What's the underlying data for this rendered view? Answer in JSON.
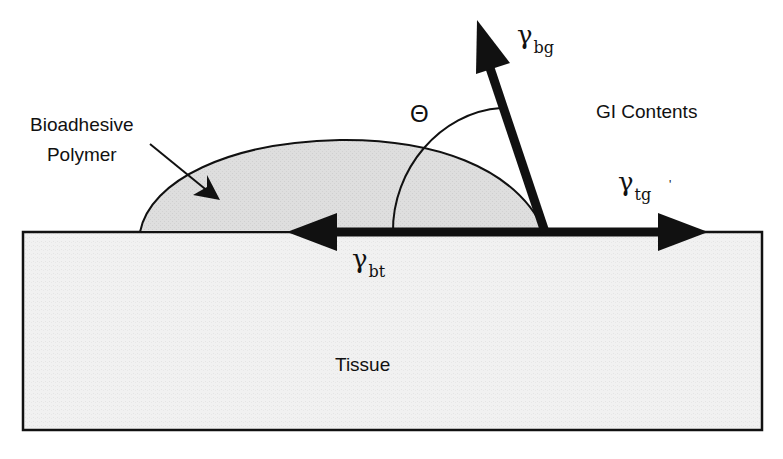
{
  "labels": {
    "bioadhesive_line1": "Bioadhesive",
    "bioadhesive_line2": "Polymer",
    "gi_contents": "GI Contents",
    "tissue": "Tissue",
    "theta": "Θ",
    "gamma_symbol": "γ",
    "gamma_bg_sub": "bg",
    "gamma_tg_sub": "tg",
    "gamma_bt_sub": "bt",
    "tick_mark": "'"
  },
  "colors": {
    "stroke": "#111111",
    "droplet_fill": "#dcdcdc",
    "tissue_fill": "#f1f1f1",
    "background": "#ffffff"
  }
}
